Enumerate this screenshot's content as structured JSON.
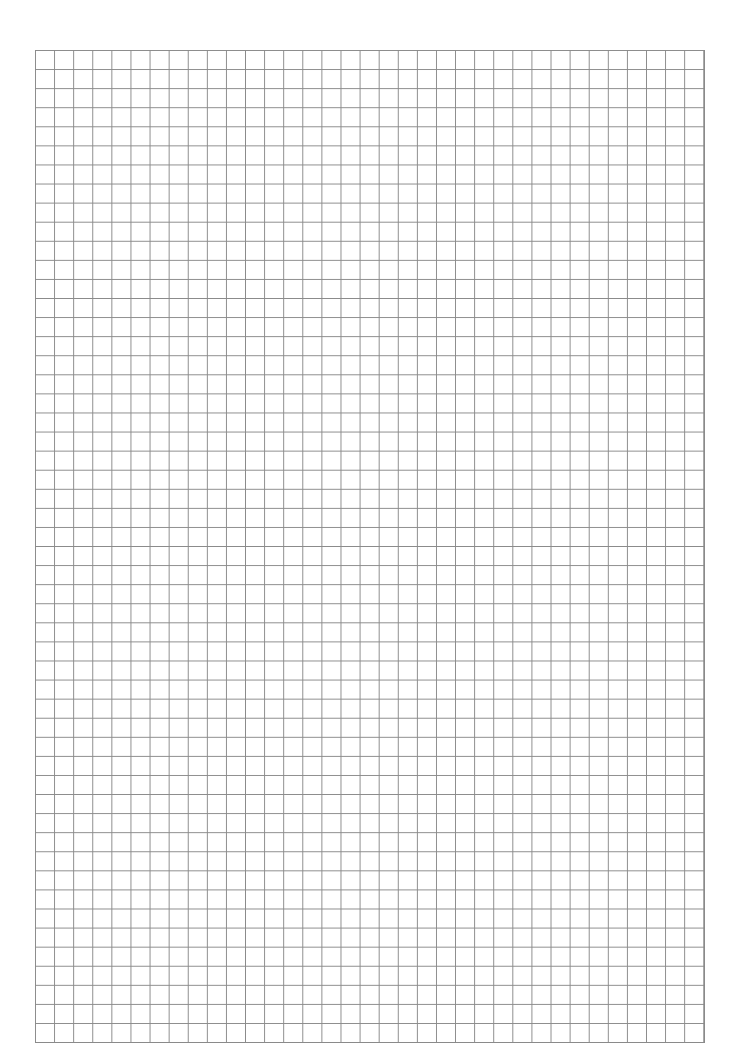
{
  "page": {
    "type": "graph-paper",
    "grid": {
      "columns": 35,
      "rows": 52,
      "line_color": "#8a8a8a",
      "background": "#ffffff"
    }
  }
}
